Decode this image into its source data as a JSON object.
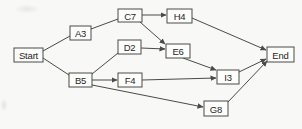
{
  "figure": {
    "background_color": "#f8f8f6",
    "node_fill_color": "#fdfdfc",
    "line_color": "#4a4a48",
    "text_color": "#262624",
    "width": 302,
    "height": 129
  },
  "diagram": {
    "nodes": [
      {
        "id": "start",
        "label": "Start",
        "x": 14,
        "y": 48,
        "w": 29,
        "h": 14
      },
      {
        "id": "a3",
        "label": "A3",
        "x": 70,
        "y": 26,
        "w": 21,
        "h": 14
      },
      {
        "id": "b5",
        "label": "B5",
        "x": 69,
        "y": 73,
        "w": 23,
        "h": 14
      },
      {
        "id": "c7",
        "label": "C7",
        "x": 118,
        "y": 9,
        "w": 24,
        "h": 13
      },
      {
        "id": "d2",
        "label": "D2",
        "x": 118,
        "y": 40,
        "w": 23,
        "h": 14
      },
      {
        "id": "f4",
        "label": "F4",
        "x": 118,
        "y": 73,
        "w": 24,
        "h": 14
      },
      {
        "id": "h4",
        "label": "H4",
        "x": 167,
        "y": 9,
        "w": 25,
        "h": 14
      },
      {
        "id": "e6",
        "label": "E6",
        "x": 166,
        "y": 44,
        "w": 24,
        "h": 14
      },
      {
        "id": "i3",
        "label": "I3",
        "x": 217,
        "y": 70,
        "w": 22,
        "h": 14
      },
      {
        "id": "g8",
        "label": "G8",
        "x": 204,
        "y": 101,
        "w": 24,
        "h": 15
      },
      {
        "id": "end",
        "label": "End",
        "x": 267,
        "y": 47,
        "w": 27,
        "h": 15
      }
    ],
    "edges": [
      {
        "from": "start",
        "to": "a3",
        "x1": 43,
        "y1": 51,
        "x2": 70,
        "y2": 36,
        "arrow": false
      },
      {
        "from": "start",
        "to": "b5",
        "x1": 43,
        "y1": 58,
        "x2": 69,
        "y2": 75,
        "arrow": false
      },
      {
        "from": "a3",
        "to": "c7",
        "x1": 91,
        "y1": 29,
        "x2": 118,
        "y2": 19,
        "arrow": false
      },
      {
        "from": "b5",
        "to": "d2",
        "x1": 92,
        "y1": 74,
        "x2": 118,
        "y2": 53,
        "arrow": false
      },
      {
        "from": "b5",
        "to": "f4",
        "x1": 92,
        "y1": 80,
        "x2": 117,
        "y2": 80,
        "arrow": true
      },
      {
        "from": "b5",
        "to": "g8",
        "x1": 92,
        "y1": 85,
        "x2": 203,
        "y2": 107,
        "arrow": true
      },
      {
        "from": "c7",
        "to": "h4",
        "x1": 142,
        "y1": 15,
        "x2": 166,
        "y2": 15,
        "arrow": true
      },
      {
        "from": "c7",
        "to": "e6",
        "x1": 140,
        "y1": 22,
        "x2": 165,
        "y2": 44,
        "arrow": true
      },
      {
        "from": "d2",
        "to": "e6",
        "x1": 141,
        "y1": 48,
        "x2": 165,
        "y2": 49,
        "arrow": true
      },
      {
        "from": "e6",
        "to": "i3",
        "x1": 183,
        "y1": 58,
        "x2": 216,
        "y2": 70,
        "arrow": true
      },
      {
        "from": "f4",
        "to": "i3",
        "x1": 142,
        "y1": 80,
        "x2": 216,
        "y2": 78,
        "arrow": true
      },
      {
        "from": "h4",
        "to": "end",
        "x1": 192,
        "y1": 18,
        "x2": 266,
        "y2": 50,
        "arrow": true
      },
      {
        "from": "i3",
        "to": "end",
        "x1": 239,
        "y1": 72,
        "x2": 266,
        "y2": 59,
        "arrow": true
      },
      {
        "from": "g8",
        "to": "end",
        "x1": 228,
        "y1": 102,
        "x2": 267,
        "y2": 61,
        "arrow": true
      }
    ]
  }
}
